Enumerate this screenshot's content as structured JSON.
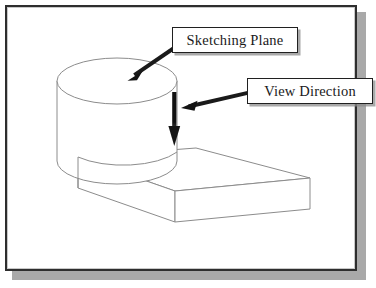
{
  "figure": {
    "type": "isometric-technical-drawing",
    "background_color": "#ffffff",
    "line_color": "#8c8c8c",
    "frame_color": "#2e2e2e",
    "shadow_color": "#a9a9a9",
    "arrow_color": "#111111"
  },
  "callouts": [
    {
      "id": "sketching-plane",
      "label": "Sketching Plane",
      "target": "cylinder top circular face",
      "leader_from": [
        176,
        46
      ],
      "leader_to": [
        129,
        79
      ]
    },
    {
      "id": "view-direction",
      "label": "View Direction",
      "target": "downward view direction arrow",
      "leader_from": [
        249,
        93
      ],
      "leader_to": [
        183,
        108
      ]
    }
  ],
  "geometry": {
    "cylinder": {
      "name": "cylindrical-boss",
      "top_ellipse_center": [
        117,
        81
      ],
      "top_ellipse_rx": 60,
      "top_ellipse_ry": 23,
      "height": 104
    },
    "base_plate": {
      "name": "rectangular-base-plate",
      "top_face": [
        [
          78,
          157
        ],
        [
          196,
          148
        ],
        [
          310,
          178
        ],
        [
          175,
          191
        ]
      ],
      "thickness": 33
    },
    "view_arrow": {
      "name": "view-direction-arrow",
      "from": [
        175,
        92
      ],
      "to": [
        175,
        144
      ],
      "direction": "down"
    }
  }
}
